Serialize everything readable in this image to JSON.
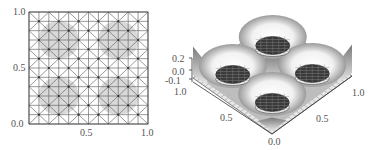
{
  "chart_data": [
    {
      "type": "scatter",
      "title": "",
      "description": "2D triangular mesh on unit square with refined regions (shaded) around four circular features",
      "xlabel": "",
      "ylabel": "",
      "xlim": [
        0.0,
        1.0
      ],
      "ylim": [
        0.0,
        1.0
      ],
      "x_ticks": [
        "0.5",
        "1.0"
      ],
      "y_ticks": [
        "0.0",
        "0.5",
        "1.0"
      ],
      "grid": true,
      "mesh": {
        "divisions": 12,
        "diagonals": "criss-cross"
      },
      "shaded_regions": [
        {
          "cx": 0.25,
          "cy": 0.75,
          "r": 0.17
        },
        {
          "cx": 0.75,
          "cy": 0.75,
          "r": 0.17
        },
        {
          "cx": 0.25,
          "cy": 0.25,
          "r": 0.17
        },
        {
          "cx": 0.75,
          "cy": 0.25,
          "r": 0.17
        }
      ]
    },
    {
      "type": "surface",
      "title": "",
      "description": "3D surface over unit square with four dark mesh-covered circular wells and peaks at corners/center",
      "zlim": [
        -0.1,
        0.2
      ],
      "z_ticks": [
        "0.2",
        "0.0",
        "-0.1"
      ],
      "x_ticks": [
        "0.0",
        "0.5",
        "1.0"
      ],
      "y_ticks": [
        "0.0",
        "0.5",
        "1.0"
      ],
      "wells": [
        {
          "x": 0.25,
          "y": 0.25
        },
        {
          "x": 0.75,
          "y": 0.25
        },
        {
          "x": 0.25,
          "y": 0.75
        },
        {
          "x": 0.75,
          "y": 0.75
        }
      ],
      "peak_height": 0.2,
      "well_depth": -0.1
    }
  ],
  "left": {
    "y_labels": {
      "top": "1.0",
      "mid": "0.5",
      "bottom": "0.0"
    },
    "x_labels": {
      "mid": "0.5",
      "right": "1.0"
    }
  },
  "right": {
    "z_labels": {
      "top": "0.2",
      "mid": "0.0",
      "bottom": "-0.1"
    },
    "left_axis": {
      "start": "1.0",
      "mid": "0.5",
      "end": "0.0"
    },
    "right_axis": {
      "mid": "0.5",
      "end": "1.0"
    }
  }
}
